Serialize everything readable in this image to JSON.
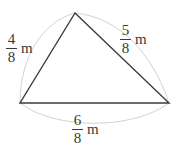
{
  "figure": {
    "name": "triangle-with-fraction-side-lengths",
    "type": "geometry-diagram",
    "background_color": "#ffffff",
    "stroke_color": "#3a3a3a",
    "arc_color": "#cfcfcf",
    "text_color": "#3a3a3a",
    "unit": "m",
    "vertices": {
      "apex": {
        "x": 75,
        "y": 13
      },
      "bottom_left": {
        "x": 20,
        "y": 103
      },
      "bottom_right": {
        "x": 169,
        "y": 103
      }
    },
    "sides": [
      {
        "id": "left",
        "position": "left",
        "numerator": "4",
        "denominator": "8",
        "unit": "m",
        "label": "4/8 m"
      },
      {
        "id": "right",
        "position": "right",
        "numerator": "5",
        "denominator": "8",
        "unit": "m",
        "label": "5/8 m"
      },
      {
        "id": "bottom",
        "position": "bottom",
        "numerator": "6",
        "denominator": "8",
        "unit": "m",
        "label": "6/8 m"
      }
    ]
  }
}
